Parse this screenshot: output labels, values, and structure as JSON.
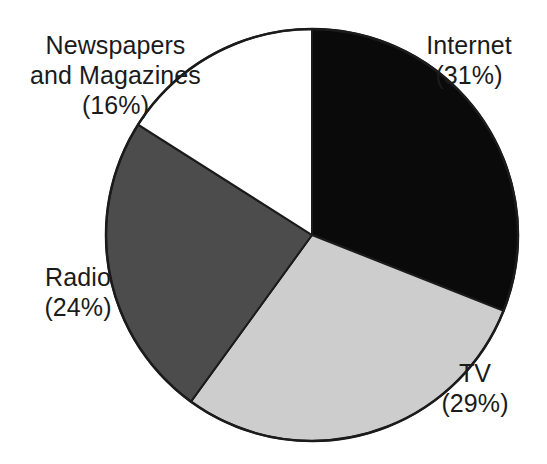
{
  "chart_data": {
    "type": "pie",
    "title": "",
    "subtitle": "",
    "xlabel": "",
    "ylabel": "",
    "legend_position": "none",
    "grid": false,
    "value_unit": "percent",
    "total": 100,
    "start_angle_deg": 0,
    "direction": "clockwise",
    "categories": [
      "Internet",
      "TV",
      "Radio",
      "Newspapers and Magazines"
    ],
    "values": [
      31,
      29,
      24,
      16
    ],
    "slices": [
      {
        "name": "Internet",
        "label_lines": [
          "Internet",
          "(31%)"
        ],
        "value": 31,
        "value_text": "31%",
        "color": "#0a0a0a",
        "stroke": "#1b1b1b",
        "start_angle_deg": 0,
        "end_angle_deg": 111.6,
        "label_position": "right-top"
      },
      {
        "name": "TV",
        "label_lines": [
          "TV",
          "(29%)"
        ],
        "value": 29,
        "value_text": "29%",
        "color": "#cdcdcd",
        "stroke": "#1b1b1b",
        "start_angle_deg": 111.6,
        "end_angle_deg": 216.0,
        "label_position": "right-bottom"
      },
      {
        "name": "Radio",
        "label_lines": [
          "Radio",
          "(24%)"
        ],
        "value": 24,
        "value_text": "24%",
        "color": "#4c4c4c",
        "stroke": "#1b1b1b",
        "start_angle_deg": 216.0,
        "end_angle_deg": 302.4,
        "label_position": "left-bottom"
      },
      {
        "name": "Newspapers and Magazines",
        "label_lines": [
          "Newspapers",
          "and Magazines",
          "(16%)"
        ],
        "value": 16,
        "value_text": "16%",
        "color": "#ffffff",
        "stroke": "#1b1b1b",
        "start_angle_deg": 302.4,
        "end_angle_deg": 360.0,
        "label_position": "left-top"
      }
    ],
    "geometry": {
      "center_x": 312,
      "center_y": 235,
      "radius": 206
    }
  },
  "labels": {
    "internet": {
      "line1": "Internet",
      "line2": "(31%)"
    },
    "tv": {
      "line1": "TV",
      "line2": "(29%)"
    },
    "radio": {
      "line1": "Radio",
      "line2": "(24%)"
    },
    "newspapers": {
      "line1": "Newspapers",
      "line2": "and Magazines",
      "line3": "(16%)"
    }
  },
  "colors": {
    "internet_slice": "#0a0a0a",
    "tv_slice": "#cdcdcd",
    "radio_slice": "#4c4c4c",
    "newspapers_slice": "#ffffff",
    "outline": "#1b1b1b",
    "text": "#1b1b1b",
    "background": "#ffffff"
  }
}
